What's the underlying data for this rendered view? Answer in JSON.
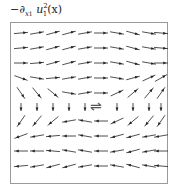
{
  "title": {
    "prefix": "−∂",
    "sub1": "x",
    "sub2": "1",
    "var": "u",
    "sup": "2",
    "varsub": "1",
    "arg": "(x)",
    "full": "−∂x₁ u₁²(x)"
  },
  "figure": {
    "type": "vector-field-quiver",
    "frame_color": "#9a9a9a",
    "arrow_color": "#222222",
    "center_symbol": "⇌",
    "rows": 10,
    "cols": 10
  },
  "field": {
    "description": "Top rows flow rightwards (slightly wavy), middle rows near center vertical, bottom rows flow leftwards; central double-arrow marks the flow reversal.",
    "angles_deg": [
      [
        5,
        10,
        15,
        15,
        10,
        0,
        -10,
        -15,
        -10,
        -5
      ],
      [
        5,
        10,
        15,
        15,
        10,
        0,
        -10,
        -15,
        -10,
        -5
      ],
      [
        0,
        5,
        15,
        15,
        10,
        0,
        -10,
        -15,
        -10,
        0
      ],
      [
        -20,
        -10,
        5,
        10,
        10,
        0,
        -10,
        15,
        25,
        30
      ],
      [
        -55,
        -50,
        -40,
        -10,
        10,
        0,
        25,
        40,
        50,
        55
      ],
      [
        -90,
        -90,
        -90,
        -90,
        -90,
        null,
        -90,
        -90,
        -90,
        -90
      ],
      [
        235,
        230,
        220,
        190,
        170,
        180,
        205,
        220,
        230,
        235
      ],
      [
        200,
        190,
        185,
        180,
        170,
        180,
        195,
        195,
        190,
        190
      ],
      [
        180,
        180,
        175,
        170,
        170,
        180,
        190,
        195,
        190,
        180
      ],
      [
        185,
        190,
        195,
        195,
        190,
        180,
        170,
        165,
        170,
        175
      ]
    ]
  }
}
